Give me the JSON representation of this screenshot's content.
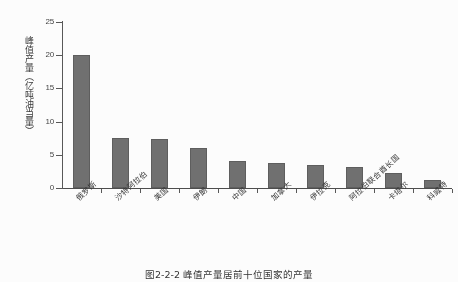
{
  "chart_data": {
    "type": "bar",
    "title": "",
    "xlabel": "",
    "ylabel": "峰值产量（亿吨油当量）",
    "ylim": [
      0,
      25
    ],
    "yticks": [
      0,
      5,
      10,
      15,
      20,
      25
    ],
    "ytick_labels": [
      "0",
      "5",
      "10",
      "15",
      "20",
      "25"
    ],
    "grid": false,
    "legend": false,
    "bar_color": "#6e6e6e",
    "categories": [
      "俄罗斯",
      "沙特阿拉伯",
      "美国",
      "伊朗",
      "中国",
      "加拿大",
      "伊拉克",
      "阿拉伯联合酋长国",
      "卡塔尔",
      "科威特"
    ],
    "values": [
      20.1,
      7.5,
      7.4,
      6.0,
      4.1,
      3.8,
      3.4,
      3.2,
      2.3,
      1.2
    ]
  },
  "caption": {
    "text": "图2-2-2  峰值产量居前十位国家的产量"
  }
}
